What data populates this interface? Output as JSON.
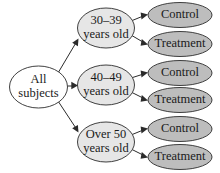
{
  "diagram": {
    "type": "tree-diagram",
    "background_color": "#ffffff",
    "stroke_color": "#2b2b2b",
    "text_color": "#1a1a1a",
    "root": {
      "id": "all-subjects",
      "label_line1": "All",
      "label_line2": "subjects",
      "fill_color": "#ffffff",
      "cx": 38.5,
      "cy": 87,
      "rx": 29,
      "ry": 21
    },
    "blocks": [
      {
        "id": "age-30-39",
        "label_line1": "30–39",
        "label_line2": "years old",
        "fill_color": "#e6e6e6",
        "cx": 106,
        "cy": 28,
        "rx": 28.5,
        "ry": 20
      },
      {
        "id": "age-40-49",
        "label_line1": "40–49",
        "label_line2": "years old",
        "fill_color": "#e6e6e6",
        "cx": 106,
        "cy": 85,
        "rx": 28.5,
        "ry": 20
      },
      {
        "id": "age-over-50",
        "label_line1": "Over 50",
        "label_line2": "years old",
        "fill_color": "#e6e6e6",
        "cx": 106,
        "cy": 142,
        "rx": 28.5,
        "ry": 20
      }
    ],
    "leaves": [
      {
        "id": "control-30-39",
        "label": "Control",
        "fill_color": "#bdbdbd",
        "cx": 180,
        "cy": 15,
        "rx": 32,
        "ry": 12.5
      },
      {
        "id": "treatment-30-39",
        "label": "Treatment",
        "fill_color": "#bdbdbd",
        "cx": 180,
        "cy": 44,
        "rx": 32,
        "ry": 12.5
      },
      {
        "id": "control-40-49",
        "label": "Control",
        "fill_color": "#bdbdbd",
        "cx": 180,
        "cy": 73,
        "rx": 32,
        "ry": 12.5
      },
      {
        "id": "treatment-40-49",
        "label": "Treatment",
        "fill_color": "#bdbdbd",
        "cx": 180,
        "cy": 100,
        "rx": 32,
        "ry": 12.5
      },
      {
        "id": "control-over-50",
        "label": "Control",
        "fill_color": "#bdbdbd",
        "cx": 180,
        "cy": 129,
        "rx": 32,
        "ry": 12.5
      },
      {
        "id": "treatment-over-50",
        "label": "Treatment",
        "fill_color": "#bdbdbd",
        "cx": 180,
        "cy": 157,
        "rx": 32,
        "ry": 12.5
      }
    ],
    "edges": [
      {
        "id": "edge-root-to-30-39",
        "from": "all-subjects",
        "to": "age-30-39"
      },
      {
        "id": "edge-root-to-40-49",
        "from": "all-subjects",
        "to": "age-40-49"
      },
      {
        "id": "edge-root-to-over-50",
        "from": "all-subjects",
        "to": "age-over-50"
      },
      {
        "id": "edge-30-39-to-control",
        "from": "age-30-39",
        "to": "control-30-39"
      },
      {
        "id": "edge-30-39-to-treatment",
        "from": "age-30-39",
        "to": "treatment-30-39"
      },
      {
        "id": "edge-40-49-to-control",
        "from": "age-40-49",
        "to": "control-40-49"
      },
      {
        "id": "edge-40-49-to-treatment",
        "from": "age-40-49",
        "to": "treatment-40-49"
      },
      {
        "id": "edge-over-50-to-control",
        "from": "age-over-50",
        "to": "control-over-50"
      },
      {
        "id": "edge-over-50-to-treatment",
        "from": "age-over-50",
        "to": "treatment-over-50"
      }
    ]
  }
}
